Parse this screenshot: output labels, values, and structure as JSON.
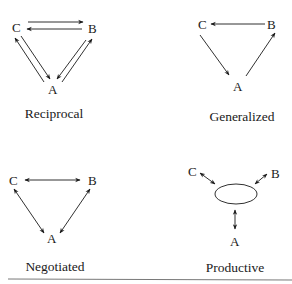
{
  "figure": {
    "panels": [
      {
        "id": "reciprocal",
        "caption": "Reciprocal",
        "nodes": [
          "A",
          "B",
          "C"
        ],
        "edges": [
          {
            "from": "C",
            "to": "B"
          },
          {
            "from": "B",
            "to": "C"
          },
          {
            "from": "C",
            "to": "A"
          },
          {
            "from": "A",
            "to": "C"
          },
          {
            "from": "B",
            "to": "A"
          },
          {
            "from": "A",
            "to": "B"
          }
        ]
      },
      {
        "id": "generalized",
        "caption": "Generalized",
        "nodes": [
          "A",
          "B",
          "C"
        ],
        "edges": [
          {
            "from": "B",
            "to": "C"
          },
          {
            "from": "C",
            "to": "A"
          },
          {
            "from": "A",
            "to": "B"
          }
        ]
      },
      {
        "id": "negotiated",
        "caption": "Negotiated",
        "nodes": [
          "A",
          "B",
          "C"
        ],
        "edges": [
          {
            "from": "C",
            "to": "B",
            "bidirectional": true
          },
          {
            "from": "C",
            "to": "A",
            "bidirectional": true
          },
          {
            "from": "B",
            "to": "A",
            "bidirectional": true
          }
        ]
      },
      {
        "id": "productive",
        "caption": "Productive",
        "nodes": [
          "A",
          "B",
          "C"
        ],
        "hub": "ellipse",
        "edges": [
          {
            "from": "C",
            "to": "hub",
            "bidirectional": true
          },
          {
            "from": "B",
            "to": "hub",
            "bidirectional": true
          },
          {
            "from": "A",
            "to": "hub",
            "bidirectional": true
          }
        ]
      }
    ]
  },
  "labels": {
    "A": "A",
    "B": "B",
    "C": "C",
    "reciprocal": "Reciprocal",
    "generalized": "Generalized",
    "negotiated": "Negotiated",
    "productive": "Productive"
  }
}
